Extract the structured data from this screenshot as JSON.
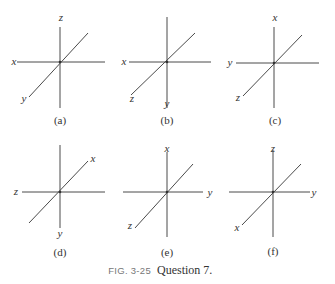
{
  "figure": {
    "number": "FIG. 3-25",
    "caption": "Question 7."
  },
  "panels": [
    {
      "id": "a",
      "label": "(a)",
      "vertical_top": "z",
      "horizontal_left": "x",
      "horizontal_right": "",
      "diagonal_upper": "",
      "diagonal_lower": "y",
      "vertical_bottom": ""
    },
    {
      "id": "b",
      "label": "(b)",
      "vertical_top": "",
      "horizontal_left": "x",
      "horizontal_right": "",
      "diagonal_upper": "",
      "diagonal_lower": "z",
      "vertical_bottom": "y"
    },
    {
      "id": "c",
      "label": "(c)",
      "vertical_top": "x",
      "horizontal_left": "y",
      "horizontal_right": "",
      "diagonal_upper": "",
      "diagonal_lower": "z",
      "vertical_bottom": ""
    },
    {
      "id": "d",
      "label": "(d)",
      "vertical_top": "",
      "horizontal_left": "z",
      "horizontal_right": "",
      "diagonal_upper": "x",
      "diagonal_lower": "",
      "vertical_bottom": "y"
    },
    {
      "id": "e",
      "label": "(e)",
      "vertical_top": "x",
      "horizontal_left": "",
      "horizontal_right": "y",
      "diagonal_upper": "",
      "diagonal_lower": "z",
      "vertical_bottom": ""
    },
    {
      "id": "f",
      "label": "(f)",
      "vertical_top": "z",
      "horizontal_left": "",
      "horizontal_right": "y",
      "diagonal_upper": "",
      "diagonal_lower": "x",
      "vertical_bottom": ""
    }
  ]
}
